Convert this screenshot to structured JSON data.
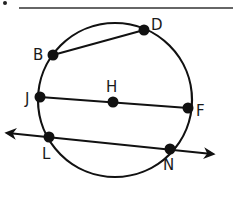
{
  "diagram": {
    "type": "circle-geometry",
    "stroke_color": "#111111",
    "answer_line": {
      "x1": 19,
      "y1": 8,
      "x2": 233,
      "y2": 8
    },
    "bullet": {
      "cx": 5,
      "cy": 3
    },
    "circle": {
      "cx": 115,
      "cy": 100,
      "r": 77
    },
    "points": [
      {
        "name": "B",
        "x": 53,
        "y": 55,
        "label": "B",
        "lx": 33,
        "ly": 60
      },
      {
        "name": "D",
        "x": 144,
        "y": 30,
        "label": "D",
        "lx": 151,
        "ly": 30
      },
      {
        "name": "H",
        "x": 113,
        "y": 102,
        "label": "H",
        "lx": 106,
        "ly": 92
      },
      {
        "name": "J",
        "x": 40,
        "y": 97,
        "label": "J",
        "lx": 25,
        "ly": 104
      },
      {
        "name": "F",
        "x": 188,
        "y": 108,
        "label": "F",
        "lx": 196,
        "ly": 116
      },
      {
        "name": "L",
        "x": 49,
        "y": 137,
        "label": "L",
        "lx": 42,
        "ly": 159
      },
      {
        "name": "N",
        "x": 170,
        "y": 149,
        "label": "N",
        "lx": 163,
        "ly": 170
      }
    ],
    "segments": [
      {
        "name": "chord-BD",
        "from": "B",
        "to": "D"
      },
      {
        "name": "diameter-JF",
        "from": "J",
        "to": "F"
      }
    ],
    "lines": [
      {
        "name": "secant-LN",
        "through": [
          "L",
          "N"
        ],
        "x1": 8,
        "y1": 133,
        "x2": 212,
        "y2": 154
      }
    ]
  }
}
